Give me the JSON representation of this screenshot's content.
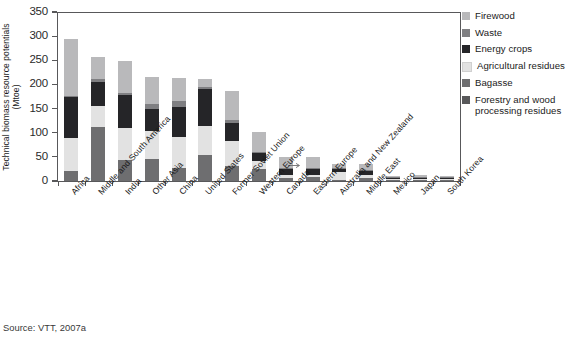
{
  "chart_data": {
    "type": "bar",
    "subtype": "stacked-bar",
    "title": "",
    "xlabel": "",
    "ylabel": "Technical biomass resource potentials (Mtoe)",
    "ylabel_line1": "Technical biomass resource potentials",
    "ylabel_line2": "(Mtoe)",
    "ylim": [
      0,
      350
    ],
    "yticks": [
      0,
      50,
      100,
      150,
      200,
      250,
      300,
      350
    ],
    "ytick_labels": [
      "0",
      "50",
      "100",
      "150",
      "200",
      "250",
      "300",
      "350"
    ],
    "grid": false,
    "legend_position": "right",
    "categories": [
      "Africa",
      "Middle and South America",
      "India",
      "Other Asia",
      "China",
      "United States",
      "Former Soviet Union",
      "Western Europe",
      "Canada",
      "Eastern Europe",
      "Australia and New Zealand",
      "Middle East",
      "Mexico",
      "Japan",
      "South Korea"
    ],
    "series": [
      {
        "name": "Forestry and wood processing residues",
        "color": "#6e6e70",
        "values": [
          20,
          13,
          9,
          9,
          13,
          12,
          32,
          24,
          7,
          9,
          3,
          6,
          2,
          1,
          0.5
        ]
      },
      {
        "name": "Bagasse",
        "color": "#6e6e70",
        "values": [
          0,
          99,
          35,
          36,
          14,
          42,
          0,
          0,
          0,
          0,
          0,
          0,
          0,
          0,
          0
        ]
      },
      {
        "name": "Agricultural residues",
        "color": "#e2e2e2",
        "values": [
          69,
          43,
          66,
          58,
          64,
          60,
          51,
          18,
          6,
          3,
          16,
          7,
          1,
          1,
          0.5
        ]
      },
      {
        "name": "Energy crops",
        "color": "#252528",
        "values": [
          84,
          50,
          68,
          46,
          62,
          76,
          38,
          17,
          11,
          12,
          6,
          8,
          2,
          1,
          0.5
        ]
      },
      {
        "name": "Waste",
        "color": "#7f7f82",
        "values": [
          4,
          6,
          5,
          11,
          13,
          5,
          5,
          2,
          2,
          2,
          1,
          1,
          1,
          1,
          0.3
        ]
      },
      {
        "name": "Firewood",
        "color": "#b9b9bb",
        "values": [
          117,
          46,
          65,
          56,
          47,
          16,
          60,
          41,
          24,
          24,
          9,
          12,
          3,
          5,
          0.7
        ]
      }
    ],
    "totals": [
      294,
      257,
      248,
      216,
      213,
      211,
      186,
      102,
      50,
      50,
      35,
      34,
      9,
      9,
      2.5
    ],
    "annotation": {
      "type": "arrow",
      "points_to": "Western Europe",
      "label": ""
    }
  },
  "legend": {
    "items": [
      {
        "label": "Firewood",
        "color": "#b9b9bb"
      },
      {
        "label": "Waste",
        "color": "#7f7f82"
      },
      {
        "label": "Energy crops",
        "color": "#252528"
      },
      {
        "label": "Agricultural residues",
        "color": "#e2e2e2"
      },
      {
        "label": "Bagasse",
        "color": "#6e6e70"
      },
      {
        "label": "Forestry and wood processing residues",
        "color": "#58585a"
      }
    ]
  },
  "source": {
    "text": "Source: VTT, 2007a"
  },
  "colors": {
    "axis": "#58585a",
    "text": "#1a1a1a",
    "background": "#ffffff"
  }
}
